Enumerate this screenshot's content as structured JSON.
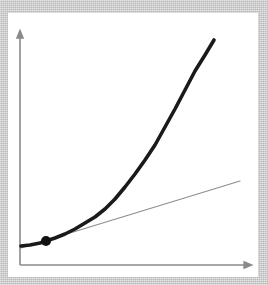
{
  "figure": {
    "background_color": "#c9c9c9",
    "plot_background_color": "#ffffff",
    "axis_color": "#8a8a8a",
    "curve_color": "#1a1a1a",
    "tangent_color": "#8e8e8e",
    "point_color": "#111111"
  },
  "axes": {
    "x_axis_name": "x-axis",
    "y_axis_name": "y-axis",
    "x_axis_label": "",
    "y_axis_label": "",
    "origin_px": [
      20,
      265
    ],
    "x_axis_end_px": [
      250,
      265
    ],
    "y_axis_end_px": [
      20,
      32
    ],
    "x_arrowhead": "right-arrow-icon",
    "y_arrowhead": "up-arrow-icon",
    "show_ticks": false,
    "show_gridlines": false,
    "show_tick_labels": false
  },
  "chart_data": {
    "type": "line",
    "subtitle": "",
    "xlabel": "",
    "ylabel": "",
    "xlim": [
      0,
      230
    ],
    "ylim": [
      0,
      233
    ],
    "grid": false,
    "legend": false,
    "legend_position": "none",
    "tick_labels": {
      "x": [],
      "y": []
    },
    "annotations": [],
    "series": [
      {
        "name": "curve",
        "role": "function",
        "style": "solid",
        "color": "#1a1a1a",
        "width_px": 3.6,
        "points_px": [
          [
            21,
            246
          ],
          [
            30,
            245
          ],
          [
            40,
            243
          ],
          [
            46,
            241
          ],
          [
            55,
            238
          ],
          [
            65,
            234
          ],
          [
            75,
            229
          ],
          [
            85,
            223
          ],
          [
            95,
            217
          ],
          [
            105,
            209
          ],
          [
            115,
            199
          ],
          [
            125,
            187
          ],
          [
            135,
            174
          ],
          [
            145,
            160
          ],
          [
            155,
            145
          ],
          [
            165,
            127
          ],
          [
            175,
            109
          ],
          [
            185,
            90
          ],
          [
            195,
            71
          ],
          [
            205,
            55
          ],
          [
            214,
            40
          ]
        ]
      },
      {
        "name": "tangent-line",
        "role": "tangent",
        "style": "solid",
        "color": "#8e8e8e",
        "width_px": 1.2,
        "points_px": [
          [
            21,
            248
          ],
          [
            240,
            181
          ]
        ]
      }
    ],
    "markers": [
      {
        "name": "tangent-point",
        "shape": "circle",
        "color": "#111111",
        "radius_px": 5,
        "position_px": [
          46,
          241
        ]
      }
    ]
  }
}
